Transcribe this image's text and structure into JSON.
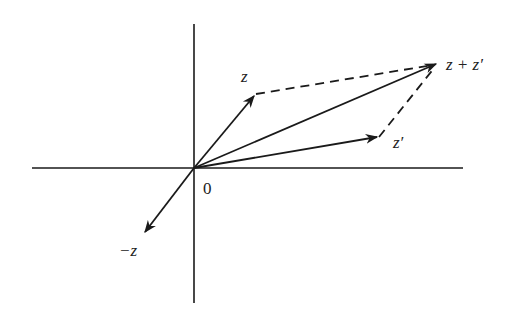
{
  "diagram": {
    "type": "vector-addition-complex-plane",
    "origin_label": "0",
    "vectors": [
      {
        "id": "z",
        "label": "z",
        "style": "solid",
        "from": [
          194,
          168
        ],
        "to": [
          256,
          94
        ]
      },
      {
        "id": "z_prime",
        "label": "z′",
        "style": "solid",
        "from": [
          194,
          168
        ],
        "to": [
          379,
          137
        ]
      },
      {
        "id": "z_plus_z_prime",
        "label": "z + z′",
        "style": "solid",
        "from": [
          194,
          168
        ],
        "to": [
          437,
          64
        ]
      },
      {
        "id": "neg_z",
        "label": "−z",
        "style": "solid",
        "from": [
          194,
          168
        ],
        "to": [
          144,
          233
        ]
      }
    ],
    "dashed_segments": [
      {
        "id": "z_to_sum",
        "from": [
          256,
          94
        ],
        "to": [
          437,
          64
        ]
      },
      {
        "id": "zprime_to_sum",
        "from": [
          379,
          137
        ],
        "to": [
          437,
          64
        ]
      }
    ],
    "axes": {
      "horizontal": {
        "from": [
          32,
          168
        ],
        "to": [
          463,
          168
        ]
      },
      "vertical": {
        "from": [
          194,
          24
        ],
        "to": [
          194,
          303
        ]
      }
    },
    "colors": {
      "stroke": "#1a1a1a",
      "background": "#ffffff"
    }
  }
}
